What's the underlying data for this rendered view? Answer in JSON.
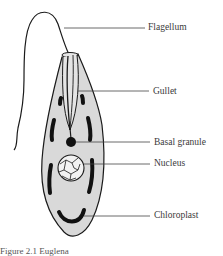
{
  "diagram": {
    "subject": "Euglena",
    "colors": {
      "body_fill": "#d9d9d9",
      "outline": "#1a1a1a",
      "leader_line": "#444444",
      "label_text": "#3a3a3a"
    },
    "labels": [
      {
        "id": "flagellum",
        "text": "Flagellum",
        "x": 148,
        "y": 22
      },
      {
        "id": "gullet",
        "text": "Gullet",
        "x": 153,
        "y": 86
      },
      {
        "id": "basal-granule",
        "text": "Basal granule",
        "x": 154,
        "y": 139
      },
      {
        "id": "nucleus",
        "text": "Nucleus",
        "x": 154,
        "y": 157
      },
      {
        "id": "chloroplast",
        "text": "Chloroplast",
        "x": 154,
        "y": 210
      }
    ],
    "caption": "Figure 2.1   Euglena"
  }
}
